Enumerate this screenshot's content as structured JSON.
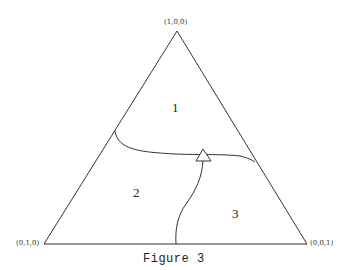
{
  "figure": {
    "caption": "Figure 3",
    "vertices": {
      "top": "(1,0,0)",
      "bottom_left": "(0,1,0)",
      "bottom_right": "(0,0,1)"
    },
    "regions": [
      {
        "id": "1",
        "label": "1"
      },
      {
        "id": "2",
        "label": "2"
      },
      {
        "id": "3",
        "label": "3"
      }
    ],
    "marker": "triangle",
    "colors": {
      "line": "#333333",
      "background": "#ffffff"
    }
  }
}
